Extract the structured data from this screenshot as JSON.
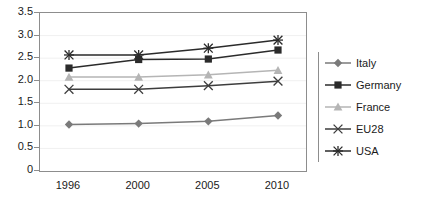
{
  "chart_data": {
    "type": "line",
    "title": "",
    "subtitle": "",
    "xlabel": "",
    "ylabel": "",
    "categories": [
      "1996",
      "2000",
      "2005",
      "2010"
    ],
    "ylim": [
      0,
      3.5
    ],
    "ytick_labels": [
      "0",
      "0.5",
      "1.0",
      "1.5",
      "2.0",
      "2.5",
      "3.0",
      "3.5"
    ],
    "ytick_values": [
      0,
      0.5,
      1.0,
      1.5,
      2.0,
      2.5,
      3.0,
      3.5
    ],
    "grid": true,
    "legend_position": "right",
    "series": [
      {
        "name": "Italy",
        "marker": "diamond",
        "color": "#7a7a7a",
        "values": [
          1.03,
          1.05,
          1.1,
          1.23
        ]
      },
      {
        "name": "Germany",
        "marker": "square",
        "color": "#2b2b2b",
        "values": [
          2.28,
          2.47,
          2.48,
          2.68
        ]
      },
      {
        "name": "France",
        "marker": "triangle",
        "color": "#b5b5b5",
        "values": [
          2.08,
          2.08,
          2.13,
          2.23
        ]
      },
      {
        "name": "EU28",
        "marker": "x",
        "color": "#3d3d3d",
        "values": [
          1.81,
          1.81,
          1.89,
          1.99
        ]
      },
      {
        "name": "USA",
        "marker": "asterisk",
        "color": "#2b2b2b",
        "values": [
          2.57,
          2.57,
          2.72,
          2.9
        ]
      }
    ]
  },
  "legend": {
    "items": [
      {
        "label": "Italy"
      },
      {
        "label": "Germany"
      },
      {
        "label": "France"
      },
      {
        "label": "EU28"
      },
      {
        "label": "USA"
      }
    ]
  }
}
